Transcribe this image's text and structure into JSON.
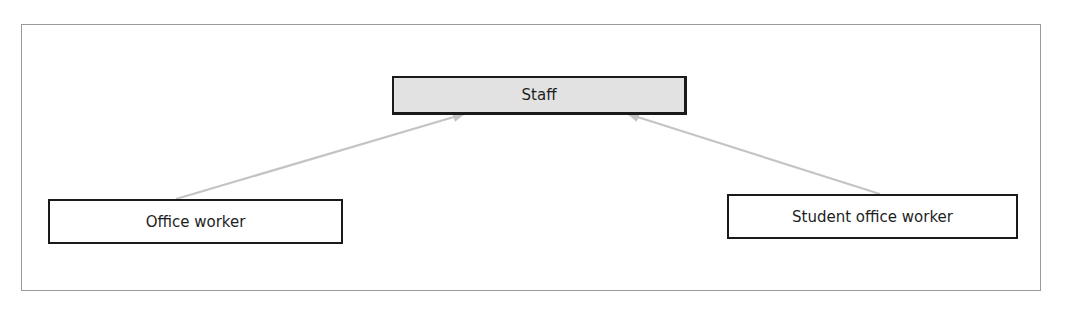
{
  "diagram": {
    "type": "generalization",
    "nodes": {
      "parent": {
        "label": "Staff"
      },
      "child_left": {
        "label": "Office worker"
      },
      "child_right": {
        "label": "Student office worker"
      }
    },
    "edges": [
      {
        "from": "Office worker",
        "to": "Staff",
        "style": "arrow"
      },
      {
        "from": "Student office worker",
        "to": "Staff",
        "style": "arrow"
      }
    ]
  },
  "colors": {
    "frame_border": "#9a9a9a",
    "node_border": "#1a1a1a",
    "parent_fill": "#e2e2e2",
    "child_fill": "#ffffff",
    "edge": "#c4c4c4",
    "text": "#1e1e1e"
  }
}
